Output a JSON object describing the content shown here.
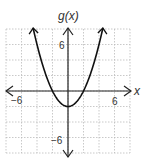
{
  "chart_data": {
    "type": "line",
    "title": "g(x)",
    "xlabel": "x",
    "ylabel": "g(x)",
    "xlim": [
      -8,
      8
    ],
    "ylim": [
      -8,
      8
    ],
    "grid": true,
    "grid_step": 2,
    "tick_labels": {
      "x": [
        "-6",
        "6"
      ],
      "y": [
        "6",
        "-6"
      ]
    },
    "function": "g(x) = 0.5x^2 - 2",
    "vertex": [
      0,
      -2
    ],
    "x_intercepts": [
      -2,
      2
    ],
    "series": [
      {
        "name": "g(x)",
        "x": [
          -4.5,
          -4,
          -3,
          -2,
          -1,
          0,
          1,
          2,
          3,
          4,
          4.5
        ],
        "values": [
          8.125,
          6,
          2.5,
          0,
          -1.5,
          -2,
          -1.5,
          0,
          2.5,
          6,
          8.125
        ]
      }
    ]
  },
  "labels": {
    "y_axis": "g(x)",
    "x_axis": "x",
    "x_neg": "−6",
    "x_pos": "6",
    "y_pos": "6",
    "y_neg": "−6"
  }
}
